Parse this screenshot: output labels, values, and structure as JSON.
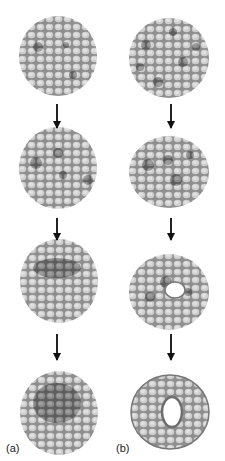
{
  "figure": {
    "columns": [
      {
        "id": "a",
        "label": "(a)",
        "center_x": 57,
        "stages": [
          "uniform disc with scattered darker cells",
          "darker cells clustering",
          "darker cells forming central patch",
          "dark central invaginating patch"
        ]
      },
      {
        "id": "b",
        "label": "(b)",
        "center_x": 170,
        "stages": [
          "disc with scattered dark cells",
          "dark cells clustering",
          "central hole forming",
          "ring / donut with central hole"
        ]
      }
    ],
    "colors": {
      "cell_light": "#c4c4c4",
      "cell_mid": "#9a9a9a",
      "cell_dark": "#707070",
      "outline": "#8a8a8a",
      "arrow": "#1a1a1a"
    }
  }
}
